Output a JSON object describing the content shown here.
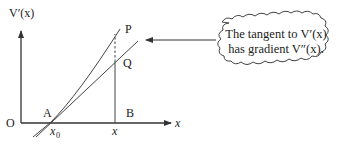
{
  "diagram": {
    "axes": {
      "y_label": "V′(x)",
      "x_label": "x",
      "origin_label": "O"
    },
    "points": {
      "A": "A",
      "B": "B",
      "P": "P",
      "Q": "Q"
    },
    "ticks": {
      "x0": "x",
      "x0_sub": "0",
      "x": "x"
    },
    "callout": {
      "line1": "The tangent to V′(x)",
      "line2": "has gradient V″(x)."
    },
    "colors": {
      "stroke": "#333333",
      "text": "#222222"
    }
  }
}
